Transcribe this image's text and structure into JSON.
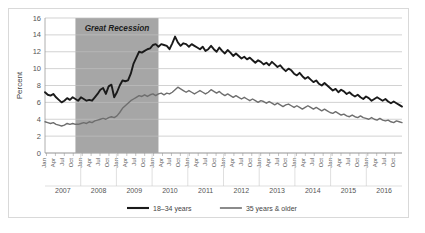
{
  "chart_data": {
    "type": "line",
    "title": "",
    "xlabel": "",
    "ylabel": "Percent",
    "ylim": [
      0,
      16
    ],
    "ytick_step": 2,
    "yticks": [
      "0",
      "2",
      "4",
      "6",
      "8",
      "10",
      "12",
      "14",
      "16"
    ],
    "grid": true,
    "legend_position": "bottom",
    "years": [
      "2007",
      "2008",
      "2009",
      "2010",
      "2011",
      "2012",
      "2013",
      "2014",
      "2015",
      "2016"
    ],
    "month_ticks": [
      "Jan",
      "Apr",
      "Jul",
      "Oct"
    ],
    "annotations": [
      {
        "text": "Great Recession",
        "type": "shaded-band-label",
        "band_start": "2007-12",
        "band_end": "2010-06",
        "band_color": "#a6a6a6"
      }
    ],
    "series": [
      {
        "name": "18–34 years",
        "color": "#1a1a1a",
        "width": 1.9,
        "values": [
          7.2,
          6.9,
          6.8,
          7.0,
          6.6,
          6.3,
          6.0,
          6.2,
          6.5,
          6.3,
          6.6,
          6.4,
          6.2,
          6.6,
          6.4,
          6.2,
          6.3,
          6.2,
          6.6,
          7.0,
          7.5,
          7.7,
          7.0,
          7.9,
          8.1,
          6.6,
          7.2,
          8.0,
          8.6,
          8.5,
          8.6,
          9.4,
          10.6,
          11.3,
          12.0,
          11.9,
          12.1,
          12.3,
          12.4,
          12.8,
          12.9,
          12.6,
          12.9,
          12.8,
          12.7,
          12.3,
          13.0,
          13.8,
          13.1,
          12.7,
          13.0,
          12.9,
          12.6,
          12.9,
          12.7,
          12.5,
          12.3,
          12.6,
          12.1,
          12.3,
          12.7,
          12.3,
          12.0,
          12.5,
          12.1,
          11.8,
          12.2,
          11.9,
          11.5,
          11.8,
          11.5,
          11.2,
          11.4,
          11.1,
          11.3,
          11.0,
          10.7,
          11.0,
          10.8,
          10.5,
          10.7,
          10.4,
          10.8,
          10.5,
          10.2,
          10.4,
          10.0,
          9.7,
          10.0,
          9.8,
          9.4,
          9.2,
          9.5,
          9.1,
          8.8,
          9.0,
          8.7,
          8.4,
          8.6,
          8.2,
          8.0,
          8.3,
          8.0,
          7.7,
          7.4,
          7.6,
          7.2,
          7.5,
          7.3,
          7.0,
          7.2,
          6.9,
          6.7,
          6.9,
          6.6,
          6.4,
          6.7,
          6.5,
          6.2,
          6.4,
          6.6,
          6.4,
          6.2,
          6.4,
          6.1,
          5.9,
          6.1,
          5.9,
          5.7,
          5.5
        ]
      },
      {
        "name": "35 years & older",
        "color": "#6e6e6e",
        "width": 1.4,
        "values": [
          3.7,
          3.6,
          3.5,
          3.6,
          3.4,
          3.3,
          3.2,
          3.3,
          3.5,
          3.4,
          3.5,
          3.4,
          3.4,
          3.5,
          3.6,
          3.5,
          3.7,
          3.6,
          3.8,
          3.9,
          4.0,
          4.1,
          4.0,
          4.2,
          4.3,
          4.2,
          4.4,
          4.8,
          5.3,
          5.6,
          5.9,
          6.2,
          6.4,
          6.6,
          6.8,
          6.7,
          6.9,
          6.7,
          6.9,
          7.0,
          6.8,
          7.0,
          7.1,
          6.9,
          7.1,
          7.0,
          7.2,
          7.5,
          7.8,
          7.6,
          7.4,
          7.2,
          7.4,
          7.2,
          7.0,
          7.2,
          7.4,
          7.2,
          7.0,
          7.2,
          7.5,
          7.3,
          7.1,
          7.3,
          7.0,
          6.8,
          7.0,
          6.8,
          6.6,
          6.8,
          6.6,
          6.4,
          6.6,
          6.4,
          6.2,
          6.4,
          6.2,
          6.0,
          6.2,
          6.1,
          5.9,
          6.1,
          5.9,
          5.7,
          5.9,
          5.7,
          5.5,
          5.7,
          5.8,
          5.6,
          5.4,
          5.6,
          5.4,
          5.2,
          5.4,
          5.6,
          5.4,
          5.2,
          5.4,
          5.2,
          5.0,
          5.2,
          5.0,
          4.8,
          4.7,
          4.9,
          4.7,
          4.5,
          4.6,
          4.4,
          4.3,
          4.5,
          4.3,
          4.2,
          4.4,
          4.2,
          4.1,
          4.0,
          4.2,
          4.0,
          3.9,
          4.1,
          3.9,
          3.8,
          3.9,
          3.7,
          3.6,
          3.8,
          3.7,
          3.6
        ]
      }
    ]
  }
}
